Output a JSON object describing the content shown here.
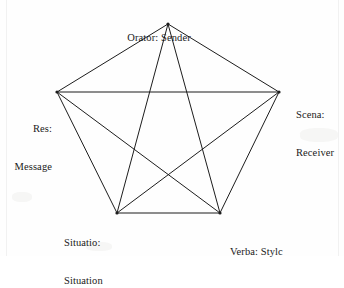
{
  "figure": {
    "name": "pentagon-communication-model",
    "background_color": "#fefefe",
    "line_color": "#1d1d1d",
    "text_color": "#1a1a1a",
    "line_width": 1
  },
  "vertices": [
    {
      "id": "orator",
      "x": 168,
      "y": 24,
      "label_lines": [
        "Orator: Sender"
      ]
    },
    {
      "id": "scena",
      "x": 279,
      "y": 92,
      "label_lines": [
        "Scena:",
        "Receiver"
      ]
    },
    {
      "id": "verba",
      "x": 220,
      "y": 213,
      "label_lines": [
        "Verba: Stylc"
      ]
    },
    {
      "id": "situatio",
      "x": 117,
      "y": 213,
      "label_lines": [
        "Situatio:",
        "Situation"
      ]
    },
    {
      "id": "res",
      "x": 57,
      "y": 92,
      "label_lines": [
        "Res:",
        "Message"
      ]
    }
  ],
  "labels": {
    "orator": {
      "line1": "Orator: Sender"
    },
    "scena": {
      "line1": "Scena:",
      "line2": "Receiver"
    },
    "res": {
      "line1": "Res:",
      "line2": "Message"
    },
    "situatio": {
      "line1": "Situatio:",
      "line2": "Situation"
    },
    "verba": {
      "line1": "Verba: Stylc"
    }
  },
  "chart_data": {
    "type": "diagram",
    "subtype": "pentagon-pentagram-network",
    "title": "",
    "node_count": 5,
    "edge_count": 10,
    "nodes": [
      {
        "id": "orator",
        "label": "Orator: Sender",
        "latin": "Orator",
        "english": "Sender",
        "position": "top",
        "x": 168,
        "y": 24
      },
      {
        "id": "scena",
        "label": "Scena: Receiver",
        "latin": "Scena",
        "english": "Receiver",
        "position": "right",
        "x": 279,
        "y": 92
      },
      {
        "id": "verba",
        "label": "Verba: Stylc",
        "latin": "Verba",
        "english": "Stylc",
        "position": "bottom-right",
        "x": 220,
        "y": 213
      },
      {
        "id": "situatio",
        "label": "Situatio: Situation",
        "latin": "Situatio",
        "english": "Situation",
        "position": "bottom-left",
        "x": 117,
        "y": 213
      },
      {
        "id": "res",
        "label": "Res: Message",
        "latin": "Res",
        "english": "Message",
        "position": "left",
        "x": 57,
        "y": 92
      }
    ],
    "edges": [
      {
        "from": "orator",
        "to": "scena",
        "kind": "pentagon-side"
      },
      {
        "from": "scena",
        "to": "verba",
        "kind": "pentagon-side"
      },
      {
        "from": "verba",
        "to": "situatio",
        "kind": "pentagon-side"
      },
      {
        "from": "situatio",
        "to": "res",
        "kind": "pentagon-side"
      },
      {
        "from": "res",
        "to": "orator",
        "kind": "pentagon-side"
      },
      {
        "from": "orator",
        "to": "verba",
        "kind": "pentagram-diagonal"
      },
      {
        "from": "verba",
        "to": "res",
        "kind": "pentagram-diagonal"
      },
      {
        "from": "res",
        "to": "scena",
        "kind": "pentagram-diagonal"
      },
      {
        "from": "scena",
        "to": "situatio",
        "kind": "pentagram-diagonal"
      },
      {
        "from": "situatio",
        "to": "orator",
        "kind": "pentagram-diagonal"
      }
    ],
    "legend": [],
    "grid": false
  }
}
